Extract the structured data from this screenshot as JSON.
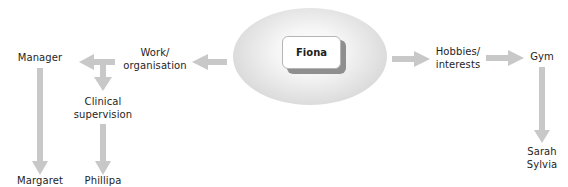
{
  "diagram": {
    "type": "relationship-map",
    "center": {
      "label": "Fiona"
    },
    "nodes": {
      "work": {
        "line1": "Work/",
        "line2": "organisation"
      },
      "manager": {
        "label": "Manager"
      },
      "clinical": {
        "line1": "Clinical",
        "line2": "supervision"
      },
      "margaret": {
        "label": "Margaret"
      },
      "phillipa": {
        "label": "Phillipa"
      },
      "hobbies": {
        "line1": "Hobbies/",
        "line2": "interests"
      },
      "gym": {
        "label": "Gym"
      },
      "sarah_sylvia": {
        "line1": "Sarah",
        "line2": "Sylvia"
      }
    },
    "edges": [
      {
        "from": "Fiona",
        "to": "Work/organisation"
      },
      {
        "from": "Work/organisation",
        "to": "Manager"
      },
      {
        "from": "Work/organisation",
        "to": "Clinical supervision"
      },
      {
        "from": "Manager",
        "to": "Margaret"
      },
      {
        "from": "Clinical supervision",
        "to": "Phillipa"
      },
      {
        "from": "Fiona",
        "to": "Hobbies/interests"
      },
      {
        "from": "Hobbies/interests",
        "to": "Gym"
      },
      {
        "from": "Gym",
        "to": "Sarah Sylvia"
      }
    ],
    "colors": {
      "arrow": "#c8c8c8",
      "ellipse_edge": "#c4c4c4",
      "text": "#1e1e1e"
    }
  }
}
